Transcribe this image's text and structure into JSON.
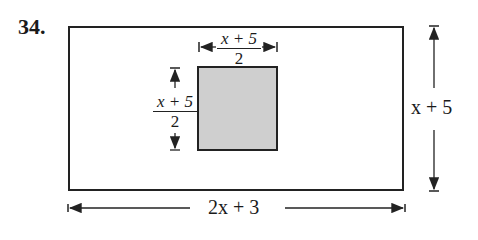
{
  "problem_number": "34.",
  "outer_rectangle": {
    "width_label": "2x + 3",
    "height_label": "x + 5"
  },
  "inner_square": {
    "width_label": {
      "numerator": "x + 5",
      "denominator": "2"
    },
    "height_label": {
      "numerator": "x + 5",
      "denominator": "2"
    },
    "fill": "#cfcfcf"
  },
  "colors": {
    "line": "#222222",
    "shade": "#cfcfcf",
    "background": "#ffffff"
  }
}
